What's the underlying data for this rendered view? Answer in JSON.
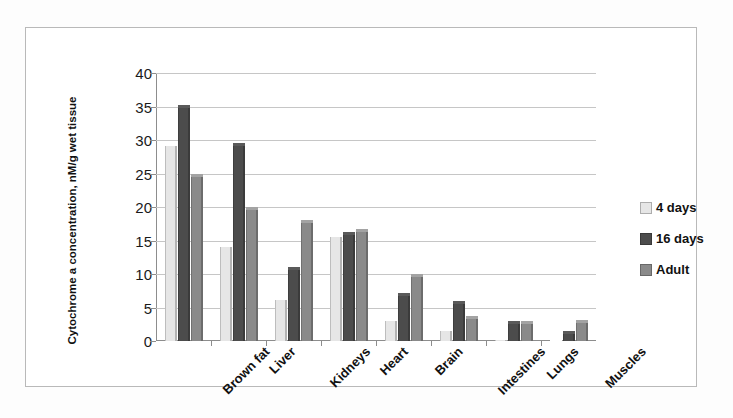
{
  "chart_data": {
    "type": "bar",
    "title": "",
    "xlabel": "",
    "ylabel": "Cytochrome a concentration, nM/g wet tissue",
    "ylim": [
      0,
      40
    ],
    "yticks": [
      0,
      5,
      10,
      15,
      20,
      25,
      30,
      35,
      40
    ],
    "grid": true,
    "legend_position": "right",
    "categories": [
      "Brown fat",
      "Liver",
      "Kidneys",
      "Heart",
      "Brain",
      "Intestines",
      "Lungs",
      "Muscles"
    ],
    "series": [
      {
        "name": "4 days",
        "color": "#e6e6e6",
        "values": [
          29.5,
          14.5,
          6.5,
          16.0,
          3.5,
          2.0,
          0.6,
          0.4
        ]
      },
      {
        "name": "16 days",
        "color": "#4c4c4c",
        "values": [
          35.3,
          29.5,
          11.0,
          16.3,
          7.2,
          6.0,
          3.0,
          1.5
        ]
      },
      {
        "name": "Adult",
        "color": "#8a8a8a",
        "values": [
          25.0,
          20.0,
          18.0,
          16.7,
          10.0,
          3.8,
          3.0,
          3.2
        ]
      }
    ]
  },
  "legend": {
    "items": [
      {
        "label": "4 days",
        "swatch": "#e6e6e6"
      },
      {
        "label": "16 days",
        "swatch": "#4c4c4c"
      },
      {
        "label": "Adult",
        "swatch": "#8a8a8a"
      }
    ]
  },
  "colors": {
    "frame": "#b9b9b9",
    "axis": "#8d8d8d",
    "grid": "#c6c6c6",
    "text": "#111111",
    "background": "#ffffff"
  }
}
